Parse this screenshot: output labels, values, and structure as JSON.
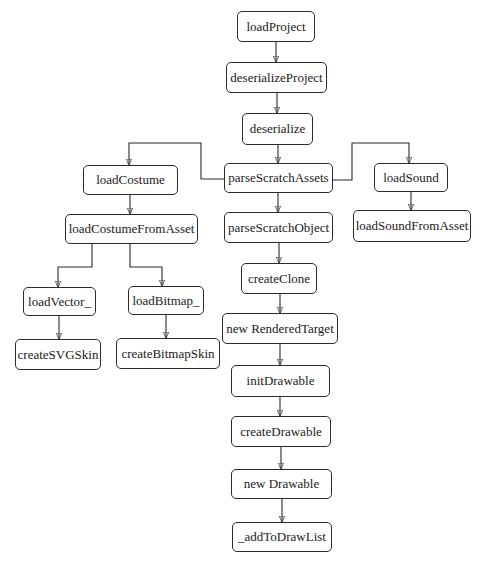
{
  "diagram": {
    "type": "call-flow",
    "nodes": [
      {
        "id": "loadProject",
        "label": "loadProject",
        "x": 237,
        "y": 11,
        "w": 78,
        "h": 31
      },
      {
        "id": "deserializeProject",
        "label": "deserializeProject",
        "x": 226,
        "y": 62,
        "w": 101,
        "h": 31
      },
      {
        "id": "deserialize",
        "label": "deserialize",
        "x": 242,
        "y": 113,
        "w": 71,
        "h": 32
      },
      {
        "id": "loadCostume",
        "label": "loadCostume",
        "x": 83,
        "y": 165,
        "w": 95,
        "h": 30
      },
      {
        "id": "parseScratchAssets",
        "label": "parseScratchAssets",
        "x": 224,
        "y": 163,
        "w": 109,
        "h": 30
      },
      {
        "id": "loadSound",
        "label": "loadSound",
        "x": 374,
        "y": 163,
        "w": 74,
        "h": 29
      },
      {
        "id": "loadCostumeFromAsset",
        "label": "loadCostumeFromAsset",
        "x": 65,
        "y": 214,
        "w": 133,
        "h": 30
      },
      {
        "id": "parseScratchObject",
        "label": "parseScratchObject",
        "x": 224,
        "y": 212,
        "w": 109,
        "h": 31
      },
      {
        "id": "loadSoundFromAsset",
        "label": "loadSoundFromAsset",
        "x": 353,
        "y": 210,
        "w": 118,
        "h": 32
      },
      {
        "id": "loadVector_",
        "label": "loadVector_",
        "x": 23,
        "y": 287,
        "w": 73,
        "h": 29
      },
      {
        "id": "loadBitmap_",
        "label": "loadBitmap_",
        "x": 128,
        "y": 286,
        "w": 76,
        "h": 29
      },
      {
        "id": "createClone",
        "label": "createClone",
        "x": 241,
        "y": 263,
        "w": 76,
        "h": 31
      },
      {
        "id": "createSVGSkin",
        "label": "createSVGSkin",
        "x": 15,
        "y": 339,
        "w": 86,
        "h": 31
      },
      {
        "id": "createBitmapSkin",
        "label": "createBitmapSkin",
        "x": 116,
        "y": 338,
        "w": 104,
        "h": 31
      },
      {
        "id": "newRenderedTarget",
        "label": "new RenderedTarget",
        "x": 222,
        "y": 313,
        "w": 116,
        "h": 31
      },
      {
        "id": "initDrawable",
        "label": "initDrawable",
        "x": 231,
        "y": 365,
        "w": 99,
        "h": 32
      },
      {
        "id": "createDrawable",
        "label": "createDrawable",
        "x": 231,
        "y": 416,
        "w": 100,
        "h": 31
      },
      {
        "id": "newDrawable",
        "label": "new Drawable",
        "x": 231,
        "y": 469,
        "w": 101,
        "h": 30
      },
      {
        "id": "addToDrawList",
        "label": "_addToDrawList",
        "x": 232,
        "y": 522,
        "w": 100,
        "h": 30
      }
    ],
    "edges": [
      {
        "from": "loadProject",
        "to": "deserializeProject",
        "path": "M276 42 L276 62"
      },
      {
        "from": "deserializeProject",
        "to": "deserialize",
        "path": "M277 93 L277 113"
      },
      {
        "from": "deserialize",
        "to": "parseScratchAssets",
        "path": "M278 145 L278 163"
      },
      {
        "from": "parseScratchAssets",
        "to": "loadCostume",
        "path": "M224 179 L201 179 L201 143 L129 143 L129 165"
      },
      {
        "from": "parseScratchAssets",
        "to": "loadSound",
        "path": "M333 180 L352 180 L352 143 L409 143 L409 163"
      },
      {
        "from": "loadCostume",
        "to": "loadCostumeFromAsset",
        "path": "M130 195 L130 214"
      },
      {
        "from": "parseScratchAssets",
        "to": "parseScratchObject",
        "path": "M278 193 L278 212"
      },
      {
        "from": "loadSound",
        "to": "loadSoundFromAsset",
        "path": "M411 192 L411 210"
      },
      {
        "from": "loadCostumeFromAsset",
        "to": "loadVector_",
        "path": "M92 244 L92 267 L58 267 L58 287"
      },
      {
        "from": "loadCostumeFromAsset",
        "to": "loadBitmap_",
        "path": "M130 244 L130 267 L162 267 L162 286"
      },
      {
        "from": "parseScratchObject",
        "to": "createClone",
        "path": "M279 243 L279 263"
      },
      {
        "from": "loadVector_",
        "to": "createSVGSkin",
        "path": "M59 316 L59 339"
      },
      {
        "from": "loadBitmap_",
        "to": "createBitmapSkin",
        "path": "M166 315 L166 338"
      },
      {
        "from": "createClone",
        "to": "newRenderedTarget",
        "path": "M280 294 L280 313"
      },
      {
        "from": "newRenderedTarget",
        "to": "initDrawable",
        "path": "M280 344 L280 365"
      },
      {
        "from": "initDrawable",
        "to": "createDrawable",
        "path": "M280 397 L280 416"
      },
      {
        "from": "createDrawable",
        "to": "newDrawable",
        "path": "M281 447 L281 469"
      },
      {
        "from": "newDrawable",
        "to": "addToDrawList",
        "path": "M282 499 L282 522"
      }
    ],
    "colors": {
      "background": "#ffffff",
      "stroke": "#2b2b2b",
      "text": "#1a1a1a"
    }
  }
}
